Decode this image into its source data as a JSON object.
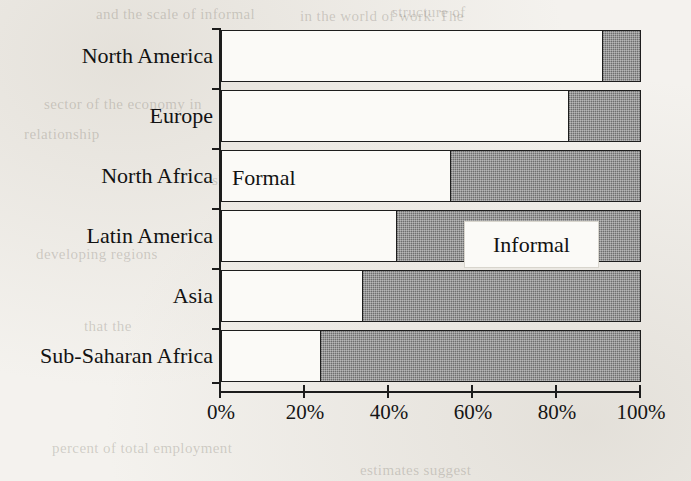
{
  "chart_data": {
    "type": "bar",
    "orientation": "horizontal",
    "stacked": true,
    "normalized_percent": true,
    "title": "",
    "subtitle": "",
    "xlabel": "",
    "ylabel": "",
    "xlim": [
      0,
      100
    ],
    "grid": false,
    "legend_position": "inline-annotations",
    "categories": [
      "North America",
      "Europe",
      "North Africa",
      "Latin America",
      "Asia",
      "Sub-Saharan Africa"
    ],
    "series": [
      {
        "name": "Formal",
        "color": "#fbfaf7",
        "values": [
          91,
          83,
          55,
          42,
          34,
          24
        ]
      },
      {
        "name": "Informal",
        "color": "#8d8d8d",
        "values": [
          9,
          17,
          45,
          58,
          66,
          76
        ]
      }
    ],
    "x_ticks": [
      0,
      20,
      40,
      60,
      80,
      100
    ],
    "x_tick_labels": [
      "0%",
      "20%",
      "40%",
      "60%",
      "80%",
      "100%"
    ],
    "annotations": [
      {
        "text": "Formal",
        "target_category": "North Africa",
        "placement": "inside-formal-segment"
      },
      {
        "text": "Informal",
        "target_category": "Latin America",
        "placement": "callout-box-over-informal-segment"
      }
    ]
  },
  "axis": {
    "x_tick_labels": [
      "0%",
      "20%",
      "40%",
      "60%",
      "80%",
      "100%"
    ],
    "category_labels": [
      "North America",
      "Europe",
      "North Africa",
      "Latin America",
      "Asia",
      "Sub-Saharan Africa"
    ]
  },
  "labels": {
    "formal": "Formal",
    "informal": "Informal"
  },
  "colors": {
    "formal_fill": "#fbfaf7",
    "informal_fill": "#8d8d8d",
    "ink": "#1c1c1c",
    "paper": "#f4f2ee"
  },
  "background_bleed": [
    {
      "text": "and the scale of informal",
      "x": 96,
      "y": 6
    },
    {
      "text": "structure of",
      "x": 392,
      "y": 4
    },
    {
      "text": "in the world of work. The",
      "x": 300,
      "y": 8
    },
    {
      "text": "sector of the economy in",
      "x": 44,
      "y": 96
    },
    {
      "text": "number of workers in",
      "x": 236,
      "y": 104
    },
    {
      "text": "relationship",
      "x": 24,
      "y": 126
    },
    {
      "text": "share of employment",
      "x": 212,
      "y": 172
    },
    {
      "text": "developing regions",
      "x": 36,
      "y": 246
    },
    {
      "text": "informal",
      "x": 254,
      "y": 290
    },
    {
      "text": "that the",
      "x": 84,
      "y": 318
    },
    {
      "text": "which is",
      "x": 320,
      "y": 340
    },
    {
      "text": "percent of total employment",
      "x": 52,
      "y": 440
    },
    {
      "text": "estimates suggest",
      "x": 360,
      "y": 462
    }
  ]
}
